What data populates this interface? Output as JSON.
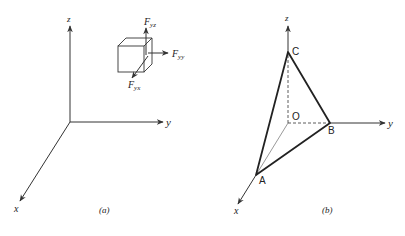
{
  "figure": {
    "panel_a": {
      "caption": "(a)",
      "axes": {
        "z": "z",
        "y": "y",
        "x": "x"
      },
      "forces": {
        "fyz": {
          "main": "F",
          "sub": "yz"
        },
        "fyy": {
          "main": "F",
          "sub": "yy"
        },
        "fyx": {
          "main": "F",
          "sub": "yx"
        }
      }
    },
    "panel_b": {
      "caption": "(b)",
      "axes": {
        "z": "z",
        "y": "y",
        "x": "x"
      },
      "points": {
        "A": "A",
        "B": "B",
        "C": "C",
        "O": "O"
      }
    },
    "colors": {
      "line": "#333333",
      "background": "#ffffff"
    }
  }
}
